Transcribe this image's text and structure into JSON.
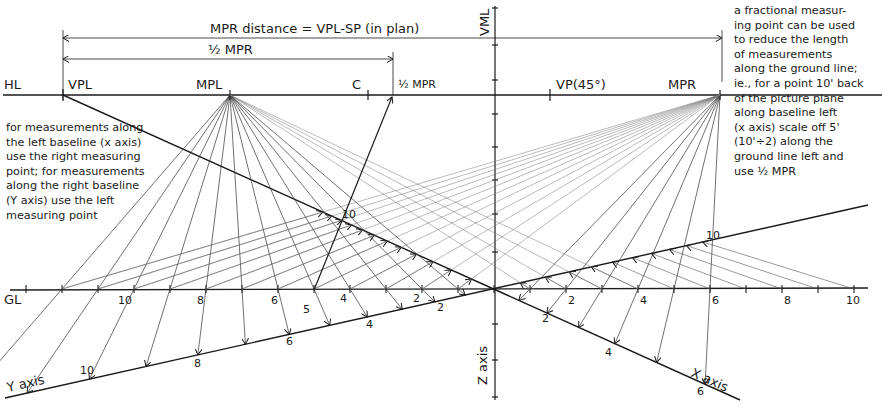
{
  "figure": {
    "labels": {
      "hl": "HL",
      "vpl": "VPL",
      "mpl": "MPL",
      "c": "C",
      "half_mpr": "½ MPR",
      "vp45": "VP(45°)",
      "mpr": "MPR",
      "vml": "VML",
      "gl": "GL",
      "y_axis": "Y axis",
      "x_axis": "X axis",
      "z_axis": "Z axis"
    },
    "dimensions": {
      "mpr_distance": "MPR distance = VPL-SP (in plan)",
      "half_mpr": "½ MPR"
    },
    "notes": {
      "left": "for measurements along\nthe left baseline (x axis)\nuse the right measuring\npoint; for measurements\nalong the right baseline\n(Y axis) use the left\nmeasuring point",
      "right": "a fractional measur-\ning point can be used\nto reduce the length\nof measurements\nalong the ground line;\nie., for a point 10' back\nof the picture plane\nalong baseline left\n(x axis) scale off 5'\n(10'÷2) along the\nground line left and\nuse ½ MPR"
    },
    "gl_left_tick_labels": [
      {
        "text": "10",
        "x": 118,
        "y": 304
      },
      {
        "text": "8",
        "x": 197,
        "y": 304
      },
      {
        "text": "6",
        "x": 271,
        "y": 304
      },
      {
        "text": "5",
        "x": 303,
        "y": 313
      },
      {
        "text": "4",
        "x": 340,
        "y": 302
      },
      {
        "text": "2",
        "x": 413,
        "y": 302
      }
    ],
    "gl_right_tick_labels": [
      {
        "text": "2",
        "x": 568,
        "y": 304
      },
      {
        "text": "4",
        "x": 640,
        "y": 304
      },
      {
        "text": "6",
        "x": 712,
        "y": 304
      },
      {
        "text": "8",
        "x": 784,
        "y": 304
      },
      {
        "text": "10",
        "x": 846,
        "y": 304
      }
    ],
    "y_axis_tick_labels": [
      {
        "text": "2",
        "x": 437,
        "y": 311
      },
      {
        "text": "4",
        "x": 366,
        "y": 328
      },
      {
        "text": "6",
        "x": 286,
        "y": 345
      },
      {
        "text": "8",
        "x": 194,
        "y": 367
      },
      {
        "text": "10",
        "x": 80,
        "y": 374
      }
    ],
    "x_axis_tick_labels": [
      {
        "text": "2",
        "x": 542,
        "y": 322
      },
      {
        "text": "4",
        "x": 605,
        "y": 356
      },
      {
        "text": "6",
        "x": 697,
        "y": 395
      }
    ],
    "receding_tick_labels": [
      {
        "text": "10",
        "x": 342,
        "y": 218
      },
      {
        "text": "10",
        "x": 706,
        "y": 239
      }
    ],
    "colors": {
      "ink": "#1a1a1a",
      "light_ink": "#6a6a6a",
      "paper": "#ffffff"
    }
  }
}
